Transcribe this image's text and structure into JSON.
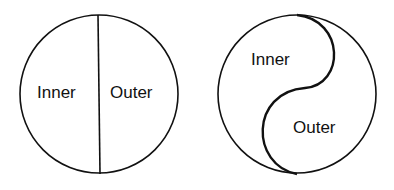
{
  "diagrams": [
    {
      "name": "split-circle",
      "labels": {
        "left": "Inner",
        "right": "Outer"
      }
    },
    {
      "name": "yin-yang-circle",
      "labels": {
        "top": "Inner",
        "bottom": "Outer"
      }
    }
  ],
  "colors": {
    "stroke": "#111111",
    "background": "#ffffff"
  }
}
